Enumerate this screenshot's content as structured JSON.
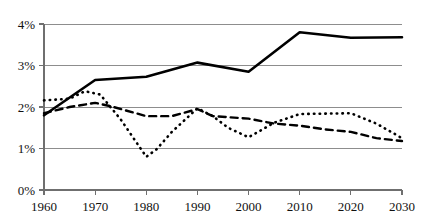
{
  "chart_data": {
    "type": "line",
    "title": "",
    "subtitle": "",
    "xlabel": "",
    "ylabel": "",
    "xlim": [
      1960,
      2030
    ],
    "ylim": [
      0,
      4
    ],
    "grid": true,
    "legend_position": "none",
    "x": [
      1960,
      1970,
      1980,
      1990,
      2000,
      2010,
      2020,
      2030
    ],
    "categories": [
      "1960",
      "1970",
      "1980",
      "1990",
      "2000",
      "2010",
      "2020",
      "2030"
    ],
    "x_tick_labels": [
      "1960",
      "1970",
      "1980",
      "1990",
      "2000",
      "2010",
      "2020",
      "2030"
    ],
    "y_tick_values": [
      0,
      1,
      2,
      3,
      4
    ],
    "y_tick_labels": [
      "0%",
      "1%",
      "2%",
      "3%",
      "4%"
    ],
    "series": [
      {
        "name": "solid-series",
        "style": "solid",
        "color": "#000000",
        "x": [
          1960,
          1970,
          1980,
          1990,
          2000,
          2010,
          2020,
          2030
        ],
        "values": [
          1.8,
          2.65,
          2.73,
          3.07,
          2.85,
          3.8,
          3.67,
          3.68
        ]
      },
      {
        "name": "dashed-series",
        "style": "dashed",
        "color": "#000000",
        "x": [
          1960,
          1970,
          1980,
          1990,
          2000,
          2010,
          2020,
          2030
        ],
        "values": [
          1.85,
          2.1,
          1.78,
          1.95,
          1.72,
          1.55,
          1.4,
          1.18
        ]
      },
      {
        "name": "dotted-series",
        "style": "dotted",
        "color": "#000000",
        "x": [
          1960,
          1970,
          1980,
          1990,
          2000,
          2010,
          2020,
          2030
        ],
        "values": [
          2.16,
          2.3,
          0.8,
          1.97,
          1.27,
          1.83,
          1.85,
          1.25
        ]
      }
    ],
    "series_detail": [
      {
        "name": "solid-series",
        "points": [
          [
            1960,
            1.8
          ],
          [
            1970,
            2.65
          ],
          [
            1980,
            2.73
          ],
          [
            1990,
            3.07
          ],
          [
            2000,
            2.85
          ],
          [
            2010,
            3.8
          ],
          [
            2020,
            3.67
          ],
          [
            2030,
            3.68
          ]
        ]
      },
      {
        "name": "dashed-series",
        "points": [
          [
            1960,
            1.85
          ],
          [
            1965,
            2.0
          ],
          [
            1970,
            2.1
          ],
          [
            1973,
            2.02
          ],
          [
            1980,
            1.78
          ],
          [
            1985,
            1.78
          ],
          [
            1990,
            1.95
          ],
          [
            1993,
            1.78
          ],
          [
            2000,
            1.72
          ],
          [
            2005,
            1.6
          ],
          [
            2010,
            1.55
          ],
          [
            2015,
            1.46
          ],
          [
            2020,
            1.4
          ],
          [
            2025,
            1.25
          ],
          [
            2030,
            1.18
          ]
        ]
      },
      {
        "name": "dotted-series",
        "points": [
          [
            1960,
            2.16
          ],
          [
            1965,
            2.2
          ],
          [
            1968,
            2.38
          ],
          [
            1971,
            2.3
          ],
          [
            1975,
            1.7
          ],
          [
            1980,
            0.8
          ],
          [
            1982,
            0.98
          ],
          [
            1985,
            1.4
          ],
          [
            1990,
            1.97
          ],
          [
            1993,
            1.78
          ],
          [
            1996,
            1.5
          ],
          [
            2000,
            1.27
          ],
          [
            2005,
            1.62
          ],
          [
            2010,
            1.83
          ],
          [
            2020,
            1.85
          ],
          [
            2025,
            1.6
          ],
          [
            2030,
            1.25
          ]
        ]
      }
    ]
  },
  "axes": {
    "y_axis_name": "percent-axis",
    "x_axis_name": "year-axis"
  }
}
